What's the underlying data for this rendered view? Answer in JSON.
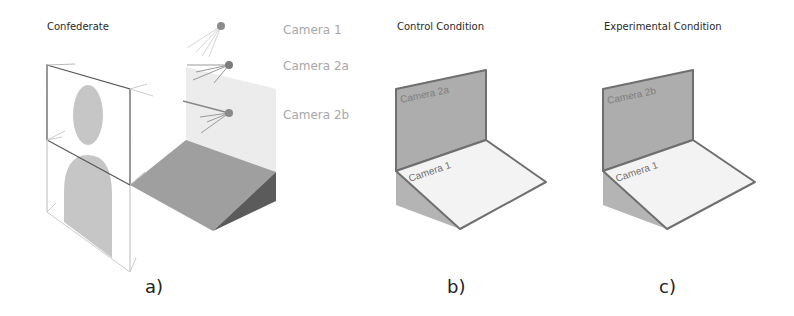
{
  "figure": {
    "panels": [
      {
        "id": "a",
        "heading": "Confederate",
        "sublabel": "a)",
        "camera_labels": [
          "Camera 1",
          "Camera 2a",
          "Camera 2b"
        ]
      },
      {
        "id": "b",
        "heading": "Control Condition",
        "sublabel": "b)",
        "wall_label": "Camera 2a",
        "floor_label": "Camera 1"
      },
      {
        "id": "c",
        "heading": "Experimental Condition",
        "sublabel": "c)",
        "wall_label": "Camera 2b",
        "floor_label": "Camera 1"
      }
    ],
    "colors": {
      "wall_dark": "#a9a9a9",
      "wall_light": "#ebebeb",
      "floor_light": "#f2f2f2",
      "ramp_top": "#9e9e9e",
      "ramp_side": "#5a5a5a",
      "silhouette": "#c4c4c4",
      "camera_dot": "#8a8a8a",
      "edge": "#6f6f6f"
    }
  }
}
